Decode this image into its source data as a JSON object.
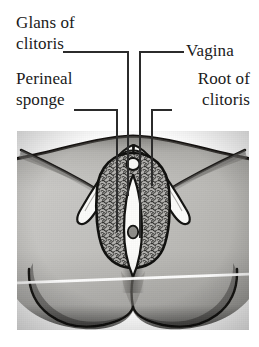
{
  "figure": {
    "kind": "anatomical-illustration",
    "rendering": "grayscale halftone photograph / scanned book plate",
    "colors": {
      "background": "#ffffff",
      "ink": "#1a1a1a",
      "skin_light": "#c8c7c4",
      "skin_mid": "#b2b1ad",
      "skin_shadow": "#8d8c88",
      "skin_dark": "#5d5c59",
      "outline": "#141414",
      "structure_fill": "#fdfdfb",
      "sponge_fill": "#9a9996",
      "scan_line": "#ffffff"
    }
  },
  "labels": [
    {
      "id": "glans-of-clitoris",
      "line1": "Glans of",
      "line2": "clitoris",
      "side": "left",
      "leader": {
        "elbow_x": 128,
        "elbow_y": 52,
        "tip_x": 128,
        "tip_y": 196
      }
    },
    {
      "id": "perineal-sponge",
      "line1": "Perineal",
      "line2": "sponge",
      "side": "left",
      "leader": {
        "elbow_x": 117,
        "elbow_y": 110,
        "tip_x": 117,
        "tip_y": 232
      }
    },
    {
      "id": "vagina",
      "line1": "Vagina",
      "line2": "",
      "side": "right",
      "leader": {
        "elbow_x": 140,
        "elbow_y": 52,
        "tip_x": 140,
        "tip_y": 238
      }
    },
    {
      "id": "root-of-clitoris",
      "line1": "Root of",
      "line2": "clitoris",
      "side": "right",
      "leader": {
        "elbow_x": 152,
        "elbow_y": 110,
        "tip_x": 152,
        "tip_y": 186
      }
    }
  ],
  "structures": [
    {
      "name": "glans of clitoris",
      "note": "small rounded body at apex of vulval cleft"
    },
    {
      "name": "perineal sponge",
      "note": "stippled erectile tissue mass flanking the vaginal canal"
    },
    {
      "name": "vagina",
      "note": "central vertical opening, pale elongated aperture"
    },
    {
      "name": "root of clitoris",
      "note": "paired crura forming an inverted V over the sponge"
    },
    {
      "name": "mons pubis",
      "note": "upper curved dome of the figure"
    },
    {
      "name": "labia / thigh folds",
      "note": "diagonal shaded creases at left and right"
    },
    {
      "name": "buttock contours",
      "note": "two lower rounded lobes below the perineum"
    }
  ],
  "artifacts": [
    {
      "name": "scan-line",
      "note": "pale white horizontal streak crossing the lower third of the scan"
    }
  ]
}
